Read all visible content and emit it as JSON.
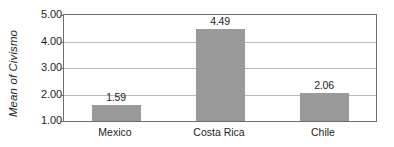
{
  "chart_data": {
    "type": "bar",
    "title": "",
    "xlabel": "",
    "ylabel": "Mean of Civismo",
    "categories": [
      "Mexico",
      "Costa Rica",
      "Chile"
    ],
    "values": [
      1.59,
      4.49,
      2.06
    ],
    "value_labels": [
      "1.59",
      "4.49",
      "2.06"
    ],
    "ylim": [
      1.0,
      5.0
    ],
    "yticks": [
      5.0,
      4.0,
      3.0,
      2.0,
      1.0
    ],
    "ytick_labels": [
      "5.00",
      "4.00",
      "3.00",
      "2.00",
      "1.00"
    ],
    "grid": true,
    "legend": "none",
    "colors": {
      "bar": "#9a9a9a",
      "frame": "#6f6f6f",
      "gridline": "#b9b9b9",
      "text": "#1d1d1d",
      "background": "#ffffff"
    }
  }
}
